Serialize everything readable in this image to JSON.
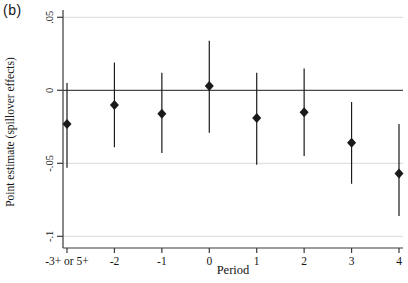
{
  "figure": {
    "panel_label": "(b)"
  },
  "chart_data": {
    "type": "scatter",
    "subtype": "point-estimates-with-confidence-intervals",
    "title": "",
    "xlabel": "Period",
    "ylabel": "Point estimate (spillover effects)",
    "categories": [
      "-3+ or 5+",
      "-2",
      "-1",
      "0",
      "1",
      "2",
      "3",
      "4"
    ],
    "series": [
      {
        "name": "point-estimate-spillover-effects",
        "values": [
          -0.023,
          -0.01,
          -0.016,
          0.003,
          -0.019,
          -0.015,
          -0.036,
          -0.057
        ],
        "ci_high": [
          0.005,
          0.019,
          0.012,
          0.034,
          0.012,
          0.015,
          -0.008,
          -0.023
        ],
        "ci_low": [
          -0.053,
          -0.039,
          -0.043,
          -0.029,
          -0.051,
          -0.045,
          -0.064,
          -0.086
        ]
      }
    ],
    "yticks": [
      0.05,
      0,
      -0.05,
      -0.1
    ],
    "ytick_labels": [
      ".05",
      "0",
      "-.05",
      "-.1"
    ],
    "ylim": [
      -0.108,
      0.055
    ],
    "refline_y": 0,
    "grid": true,
    "legend": "none",
    "marker": "diamond",
    "colors": {
      "marker": "#1a1a1a",
      "ci": "#1a1a1a",
      "axis": "#3a3a3a",
      "grid": "#d9d9d9",
      "refline": "#4a4a4a",
      "background": "#ffffff",
      "text": "#141414"
    }
  }
}
